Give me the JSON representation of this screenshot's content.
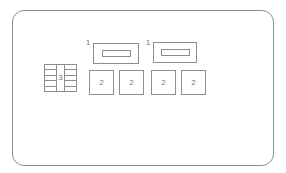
{
  "diagram": {
    "panel": {
      "name": "fuse-box-panel",
      "stroke_color": "#8d8d8d",
      "fill_color": "#ffffff"
    },
    "callouts": [
      {
        "label": "1",
        "x": 85,
        "y": 38
      },
      {
        "label": "1",
        "x": 145,
        "y": 38
      }
    ],
    "relays": [
      {
        "label": "1",
        "x": 92,
        "y": 42,
        "w": 46,
        "h": 21
      },
      {
        "label": "1",
        "x": 152,
        "y": 41,
        "w": 44,
        "h": 21
      }
    ],
    "fuses": [
      {
        "label": "2",
        "x": 88,
        "y": 69,
        "w": 25,
        "h": 25
      },
      {
        "label": "2",
        "x": 118,
        "y": 69,
        "w": 25,
        "h": 25
      },
      {
        "label": "2",
        "x": 150,
        "y": 69,
        "w": 25,
        "h": 25
      },
      {
        "label": "2",
        "x": 180,
        "y": 69,
        "w": 25,
        "h": 25
      }
    ],
    "multi_fuse_block": {
      "label": "3",
      "x": 43,
      "y": 63,
      "w": 33,
      "h": 28,
      "rows_per_column": 5
    }
  }
}
